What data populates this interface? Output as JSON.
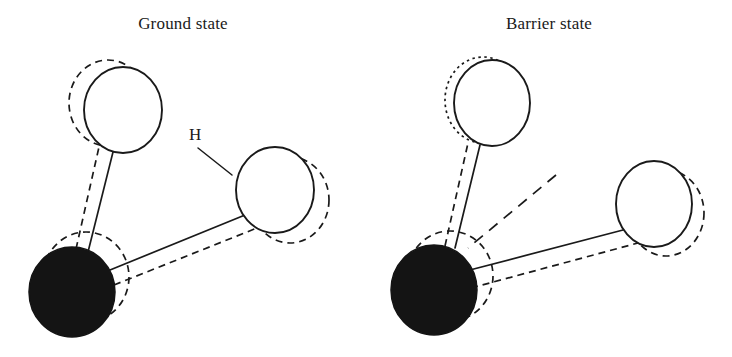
{
  "figure": {
    "domain_description": "Two-panel schematic of a triatomic molecule showing atomic displacement between two configurations",
    "background_color": "#ffffff",
    "line_color": "#1a1a1a",
    "filled_atom_color": "#141414"
  },
  "panels": [
    {
      "id": "ground",
      "title": "Ground state",
      "atoms": [
        {
          "name": "heavy-atom",
          "style": "filled",
          "cx": 72,
          "cy": 292,
          "rx": 43,
          "ry": 45,
          "ghost": {
            "style": "dashed",
            "cx": 86,
            "cy": 277,
            "rx": 43,
            "ry": 45
          }
        },
        {
          "name": "upper-atom",
          "style": "open",
          "cx": 123,
          "cy": 110,
          "rx": 39,
          "ry": 43,
          "ghost": {
            "style": "dashed",
            "cx": 108,
            "cy": 103,
            "rx": 39,
            "ry": 43
          }
        },
        {
          "name": "hydrogen-atom",
          "style": "open",
          "cx": 275,
          "cy": 190,
          "rx": 39,
          "ry": 43,
          "ghost": {
            "style": "dashed",
            "cx": 290,
            "cy": 200,
            "rx": 39,
            "ry": 43
          }
        }
      ],
      "bonds": [
        {
          "name": "bond-heavy-upper",
          "style": "solid",
          "x1": 88,
          "y1": 252,
          "x2": 113,
          "y2": 152
        },
        {
          "name": "bond-heavy-upper-ghost",
          "style": "dashed",
          "x1": 76,
          "y1": 249,
          "x2": 99,
          "y2": 147
        },
        {
          "name": "bond-heavy-hydrogen",
          "style": "solid",
          "x1": 110,
          "y1": 270,
          "x2": 245,
          "y2": 215
        },
        {
          "name": "bond-heavy-hydrogen-ghost",
          "style": "dashed",
          "x1": 114,
          "y1": 285,
          "x2": 262,
          "y2": 226
        }
      ],
      "labels": [
        {
          "name": "h-label",
          "text": "H",
          "leader_style": "solid",
          "leader": {
            "x1": 198,
            "y1": 148,
            "x2": 232,
            "y2": 175
          }
        }
      ]
    },
    {
      "id": "barrier",
      "title": "Barrier state",
      "atoms": [
        {
          "name": "heavy-atom",
          "style": "filled",
          "cx": 68,
          "cy": 290,
          "rx": 43,
          "ry": 45,
          "ghost": {
            "style": "dashed",
            "cx": 84,
            "cy": 276,
            "rx": 43,
            "ry": 45
          }
        },
        {
          "name": "upper-atom",
          "style": "open",
          "cx": 126,
          "cy": 103,
          "rx": 38,
          "ry": 43,
          "ghost": {
            "style": "dotted",
            "cx": 117,
            "cy": 100,
            "rx": 38,
            "ry": 43
          }
        },
        {
          "name": "hydrogen-atom",
          "style": "open",
          "cx": 288,
          "cy": 204,
          "rx": 38,
          "ry": 43,
          "ghost": {
            "style": "dashed",
            "cx": 300,
            "cy": 213,
            "rx": 38,
            "ry": 43
          }
        }
      ],
      "bonds": [
        {
          "name": "bond-heavy-upper",
          "style": "solid",
          "x1": 89,
          "y1": 248,
          "x2": 114,
          "y2": 145
        },
        {
          "name": "bond-heavy-upper-ghost",
          "style": "dashed",
          "x1": 79,
          "y1": 246,
          "x2": 102,
          "y2": 143
        },
        {
          "name": "bond-heavy-hydrogen",
          "style": "solid",
          "x1": 100,
          "y1": 271,
          "x2": 257,
          "y2": 230
        },
        {
          "name": "bond-heavy-hydrogen-ghost",
          "style": "dashed",
          "x1": 105,
          "y1": 288,
          "x2": 272,
          "y2": 243
        }
      ],
      "labels": [
        {
          "name": "h-label",
          "text": "H",
          "leader_style": "dashed",
          "leader": {
            "x1": 190,
            "y1": 175,
            "x2": 102,
            "y2": 248
          }
        }
      ]
    }
  ]
}
